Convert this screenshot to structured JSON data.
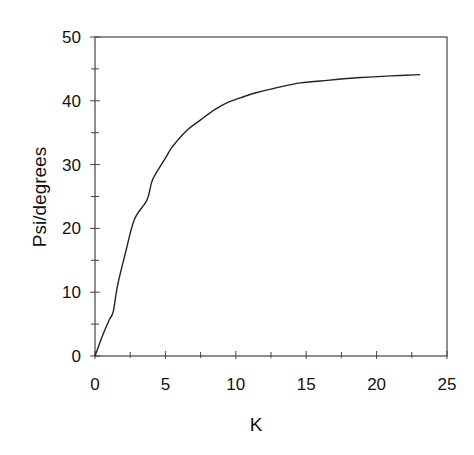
{
  "chart_data": {
    "type": "line",
    "title": "",
    "xlabel": "K",
    "ylabel": "Psi/degrees",
    "xlim": [
      0,
      25
    ],
    "ylim": [
      0,
      50
    ],
    "xticks": [
      0,
      5,
      10,
      15,
      20,
      25
    ],
    "yticks": [
      0,
      10,
      20,
      30,
      40,
      50
    ],
    "xtick_labels": [
      "0",
      "5",
      "10",
      "15",
      "20",
      "25"
    ],
    "ytick_labels": [
      "0",
      "10",
      "20",
      "30",
      "40",
      "50"
    ],
    "grid": false,
    "legend": null,
    "series": [
      {
        "name": "Psi",
        "color": "#222222",
        "x": [
          0,
          0.5,
          1.0,
          1.3,
          1.6,
          2.2,
          2.8,
          3.7,
          4.1,
          5.0,
          5.5,
          6.5,
          7.5,
          8.5,
          9.4,
          10.5,
          11.5,
          13.0,
          14.6,
          16.5,
          18.6,
          21.0,
          23.1
        ],
        "y": [
          0,
          3.0,
          5.6,
          7.0,
          11.0,
          16.5,
          21.4,
          24.5,
          27.7,
          31.0,
          32.8,
          35.3,
          37.0,
          38.6,
          39.7,
          40.6,
          41.3,
          42.1,
          42.8,
          43.2,
          43.6,
          43.9,
          44.1
        ]
      }
    ]
  }
}
